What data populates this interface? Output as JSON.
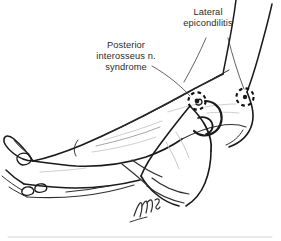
{
  "figure": {
    "kind": "anatomical-line-drawing",
    "background_color": "#ffffff",
    "ink_color": "#1a1a1a",
    "faint_ink_color": "#9a9aa0"
  },
  "labels": [
    {
      "id": "lateral-epicondilitis",
      "text": "Lateral\nepicondilitis",
      "line1": "Lateral",
      "line2": "epicondilitis",
      "full": "Lateral epicondilitis"
    },
    {
      "id": "posterior-interosseus-nerve-syndrome",
      "text": "Posterior\ninterosseus n.\nsyndrome",
      "line1": "Posterior",
      "line2": "interosseus n.",
      "line3": "syndrome",
      "full": "Posterior interosseus n. syndrome"
    }
  ],
  "markers": [
    {
      "id": "pin-marker",
      "name": "posterior-interosseus-nerve-point",
      "style": "dashed-circle-with-center-dot",
      "cx": 197,
      "cy": 101,
      "r": 9
    },
    {
      "id": "epicondyle-marker",
      "name": "lateral-epicondyle-point",
      "style": "dashed-circle-with-center-dot",
      "cx": 245,
      "cy": 97,
      "r": 9
    }
  ],
  "signature": {
    "present": true,
    "description": "artist signature initials",
    "x": 138,
    "y": 210
  }
}
